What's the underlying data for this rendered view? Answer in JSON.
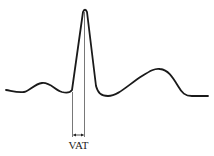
{
  "diagram": {
    "type": "ecg-waveform",
    "stroke_color": "#1a1a1a",
    "guide_color": "#555555",
    "annotation": {
      "label": "VAT",
      "start_x": 72,
      "end_x": 84
    },
    "waves": [
      "P",
      "QRS",
      "T"
    ]
  }
}
